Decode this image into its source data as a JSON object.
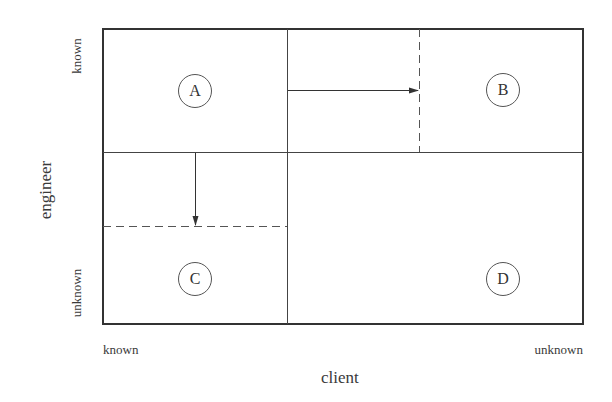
{
  "diagram": {
    "x_axis": {
      "title": "client",
      "low_label": "known",
      "high_label": "unknown"
    },
    "y_axis": {
      "title": "engineer",
      "high_label": "known",
      "low_label": "unknown"
    },
    "quadrants": [
      {
        "id": "A",
        "label": "A",
        "client": "known",
        "engineer": "known"
      },
      {
        "id": "B",
        "label": "B",
        "client": "unknown",
        "engineer": "known"
      },
      {
        "id": "C",
        "label": "C",
        "client": "known",
        "engineer": "unknown"
      },
      {
        "id": "D",
        "label": "D",
        "client": "unknown",
        "engineer": "unknown"
      }
    ],
    "arrows": [
      {
        "from": "A",
        "to": "B",
        "direction": "right",
        "style": "solid",
        "boundary": "dashed"
      },
      {
        "from": "A",
        "to": "C",
        "direction": "down",
        "style": "solid",
        "boundary": "dashed"
      }
    ],
    "colors": {
      "line": "#333333",
      "background": "#ffffff"
    }
  }
}
